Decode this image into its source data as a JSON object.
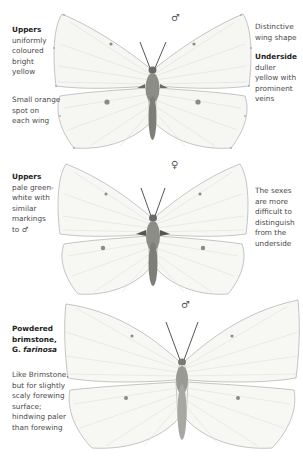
{
  "plates": [
    {
      "sex_symbol": "♂",
      "left_caption": {
        "heading": "Uppers",
        "lines": [
          "uniformly",
          "coloured",
          "bright",
          "yellow"
        ],
        "note_lines": [
          "Small orange",
          "spot on",
          "each wing"
        ]
      },
      "right_caption": {
        "lines_top": [
          "Distinctive",
          "wing shape"
        ],
        "heading": "Underside",
        "lines": [
          "duller",
          "yellow with",
          "prominent",
          "veins"
        ]
      }
    },
    {
      "sex_symbol": "♀",
      "left_caption": {
        "heading": "Uppers",
        "lines": [
          "pale green-",
          "white with",
          "similar",
          "markings",
          "to ♂"
        ]
      },
      "right_caption": {
        "lines": [
          "The sexes",
          "are more",
          "difficult to",
          "distinguish",
          "from the",
          "underside"
        ]
      }
    },
    {
      "sex_symbol": "♂",
      "left_caption": {
        "heading_lines": [
          "Powdered",
          "brimstone,"
        ],
        "heading_italic_prefix": "G. ",
        "heading_italic": "farinosa",
        "lines": [
          "Like Brimstone,",
          "but for slightly",
          "scaly forewing",
          "surface;",
          "hindwing paler",
          "than forewing"
        ]
      }
    }
  ],
  "colors": {
    "wing_fill": "#f6f6f3",
    "wing_edge": "#9a9a9a",
    "vein": "#d6d6d2",
    "spot": "#8a8a86",
    "body": "#6f6f6a"
  }
}
